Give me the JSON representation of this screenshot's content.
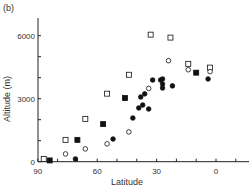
{
  "panel_label": "(b)",
  "chart_data": {
    "type": "scatter",
    "title": "",
    "xlabel": "Latitude",
    "ylabel": "Altitude (m)",
    "xlim": [
      90,
      -15
    ],
    "ylim": [
      0,
      6700
    ],
    "x_ticks": [
      90,
      60,
      30,
      0
    ],
    "y_ticks": [
      0,
      3000,
      6000
    ],
    "grid": false,
    "legend": null,
    "series": [
      {
        "name": "open-square",
        "marker": "square-open",
        "points": [
          [
            87,
            130
          ],
          [
            76,
            1040
          ],
          [
            66,
            2040
          ],
          [
            55,
            3240
          ],
          [
            44,
            4140
          ],
          [
            33,
            6050
          ],
          [
            23,
            5910
          ],
          [
            14,
            4660
          ],
          [
            3,
            4480
          ]
        ]
      },
      {
        "name": "filled-square",
        "marker": "square-filled",
        "points": [
          [
            84,
            60
          ],
          [
            70,
            1040
          ],
          [
            57,
            1790
          ],
          [
            46,
            3030
          ],
          [
            10,
            4240
          ]
        ]
      },
      {
        "name": "open-circle",
        "marker": "circle-open",
        "points": [
          [
            76,
            370
          ],
          [
            66,
            610
          ],
          [
            55,
            850
          ],
          [
            44,
            1420
          ],
          [
            34,
            3490
          ],
          [
            24,
            4810
          ],
          [
            14,
            4380
          ],
          [
            3,
            4290
          ]
        ]
      },
      {
        "name": "filled-circle",
        "marker": "circle-filled",
        "points": [
          [
            71,
            130
          ],
          [
            52,
            1080
          ],
          [
            42,
            2080
          ],
          [
            39,
            2560
          ],
          [
            37,
            2700
          ],
          [
            34,
            2510
          ],
          [
            38,
            3080
          ],
          [
            36,
            3230
          ],
          [
            32,
            3890
          ],
          [
            28,
            3890
          ],
          [
            27,
            3940
          ],
          [
            27,
            3700
          ],
          [
            27,
            3510
          ],
          [
            22,
            3610
          ],
          [
            4,
            3940
          ]
        ]
      }
    ]
  }
}
